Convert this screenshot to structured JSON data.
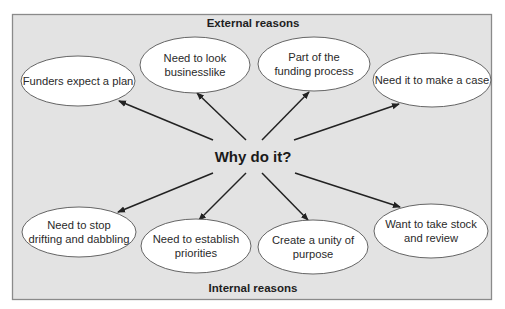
{
  "diagram": {
    "center": {
      "label": "Why do it?",
      "x": 253,
      "y": 162
    },
    "external_label": "External reasons",
    "internal_label": "Internal reasons",
    "colors": {
      "background": "#e3e3e3",
      "node_fill": "#ffffff",
      "text": "#2a2a2a",
      "arrow": "#222222",
      "frame": "#8a8a8a"
    },
    "external_nodes": [
      {
        "lines": [
          "Funders expect a plan"
        ],
        "cx": 78,
        "cy": 81,
        "rx": 57,
        "ry": 25,
        "arrow": {
          "x1": 213,
          "y1": 140,
          "x2": 119,
          "y2": 101
        }
      },
      {
        "lines": [
          "Need to look",
          "businesslike"
        ],
        "cx": 195,
        "cy": 65,
        "rx": 55,
        "ry": 28,
        "arrow": {
          "x1": 246,
          "y1": 140,
          "x2": 197,
          "y2": 93
        }
      },
      {
        "lines": [
          "Part of the",
          "funding process"
        ],
        "cx": 314,
        "cy": 64,
        "rx": 56,
        "ry": 27,
        "arrow": {
          "x1": 262,
          "y1": 140,
          "x2": 309,
          "y2": 92
        }
      },
      {
        "lines": [
          "Need it to make a case"
        ],
        "cx": 432,
        "cy": 80,
        "rx": 59,
        "ry": 27,
        "arrow": {
          "x1": 294,
          "y1": 140,
          "x2": 399,
          "y2": 104
        }
      }
    ],
    "internal_nodes": [
      {
        "lines": [
          "Need to stop",
          "drifting and dabbling"
        ],
        "cx": 79,
        "cy": 232,
        "rx": 57,
        "ry": 25,
        "arrow": {
          "x1": 213,
          "y1": 173,
          "x2": 118,
          "y2": 212
        }
      },
      {
        "lines": [
          "Need to establish",
          "priorities"
        ],
        "cx": 196,
        "cy": 246,
        "rx": 55,
        "ry": 27,
        "arrow": {
          "x1": 246,
          "y1": 173,
          "x2": 199,
          "y2": 220
        }
      },
      {
        "lines": [
          "Create a unity of",
          "purpose"
        ],
        "cx": 313,
        "cy": 247,
        "rx": 55,
        "ry": 27,
        "arrow": {
          "x1": 262,
          "y1": 173,
          "x2": 308,
          "y2": 220
        }
      },
      {
        "lines": [
          "Want to take stock",
          "and review"
        ],
        "cx": 431,
        "cy": 231,
        "rx": 57,
        "ry": 27,
        "arrow": {
          "x1": 295,
          "y1": 173,
          "x2": 400,
          "y2": 207
        }
      }
    ]
  }
}
